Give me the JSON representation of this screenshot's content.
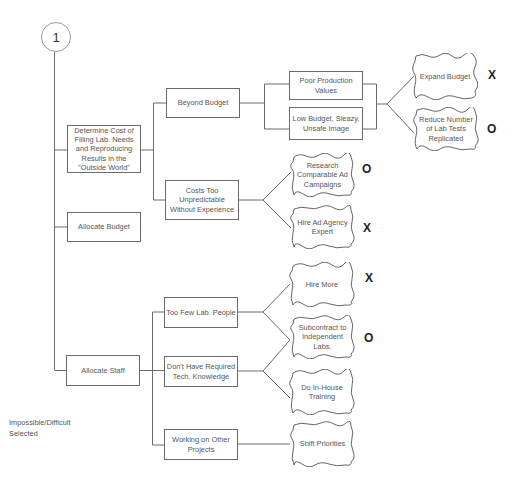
{
  "diagram": {
    "step_number": "1",
    "nodes": {
      "determine_cost": "Determine Cost of Filling Lab. Needs and Reproducing Results in the \"Outside World\"",
      "allocate_budget": "Allocate Budget",
      "allocate_staff": "Allocate Staff",
      "beyond_budget": "Beyond Budget",
      "costs_too_unpredictable": "Costs Too Unpredictable Without Experience",
      "poor_production_values": "Poor Production Values",
      "low_budget_image": "Low Budget, Sleazy, Unsafe Image",
      "too_few_lab_people": "Too Few Lab. People",
      "dont_have_tech_knowledge": "Don't Have Required Tech. Knowledge",
      "working_on_other_projects": "Working on Other Projects"
    },
    "solutions": {
      "expand_budget": {
        "label": "Expand Budget",
        "mark": "X"
      },
      "reduce_lab_tests": {
        "label": "Reduce Number of Lab Tests Replicated",
        "mark": "O"
      },
      "research_ad_campaigns": {
        "label": "Research Comparable Ad Campaigns",
        "mark": "O"
      },
      "hire_ad_agency": {
        "label": "Hire Ad Agency Expert",
        "mark": "X"
      },
      "hire_more": {
        "label": "Hire More",
        "mark": "X"
      },
      "subcontract_labs": {
        "label": "Subcontract to Independent Labs.",
        "mark": "O"
      },
      "in_house_training": {
        "label": "Do In-House Training",
        "mark": ""
      },
      "shift_priorities": {
        "label": "Shift Priorities",
        "mark": ""
      }
    },
    "legend": {
      "line1": "Impossible/Difficult",
      "line2": "Selected"
    },
    "colors": {
      "line": "#6a6a6a",
      "text": "#555555",
      "mark": "#222222"
    }
  }
}
